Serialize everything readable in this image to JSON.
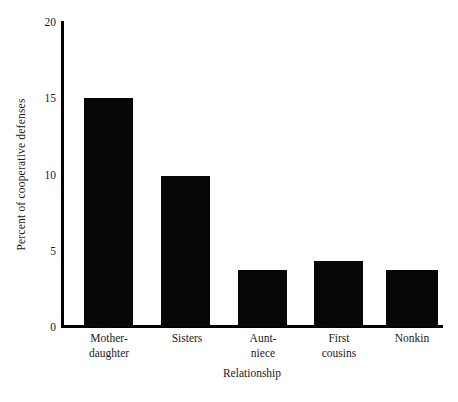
{
  "chart_data": {
    "type": "bar",
    "title": "",
    "xlabel": "Relationship",
    "ylabel": "Percent of cooperative defenses",
    "categories": [
      "Mother-\ndaughter",
      "Sisters",
      "Aunt-\nniece",
      "First\ncousins",
      "Nonkin"
    ],
    "values": [
      15.0,
      9.9,
      3.75,
      4.3,
      3.75
    ],
    "ylim": [
      0,
      20
    ],
    "yticks": [
      0,
      5,
      10,
      15,
      20
    ],
    "ytick_labels": [
      "0",
      "5",
      "10",
      "15",
      "20"
    ],
    "grid": false,
    "legend": false,
    "bar_color": "#070707",
    "axis_color": "#000000",
    "background": "#ffffff"
  }
}
